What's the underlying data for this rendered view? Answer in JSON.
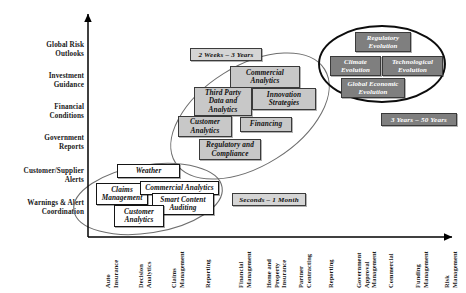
{
  "figure": {
    "title": "",
    "background": "#ffffff",
    "axis_color": "#000000"
  },
  "chart_data": {
    "type": "scatter",
    "title": "",
    "xlabel": "",
    "ylabel": "",
    "grid": false,
    "legend": "none",
    "y_categories": [
      "Global Risk\nOutlooks",
      "Investment\nGuidance",
      "Financial\nConditions",
      "Government\nReports",
      "Customer/Supplier\nAlerts",
      "Warnings & Alert\nCoordination"
    ],
    "x_categories": [
      "Auto\nInsurance",
      "Decision\nAnalytics",
      "Claims\nManagement",
      "Reporting",
      "Financial\nManagement",
      "Home and\nProperty\nInsurance",
      "Partner\nContracting",
      "Reporting",
      "Government\nApproval\nManagement",
      "Commercial",
      "Funding\nManagement",
      "Risk\nManagement"
    ],
    "clusters": [
      {
        "name": "near-term-cluster",
        "timeframe_tag": "Seconds – 1 Month",
        "tag_style": "light",
        "box_style": "white",
        "items": [
          "Weather",
          "Claims\nManagement",
          "Commercial Analytics",
          "Smart Content\nAuditing",
          "Customer\nAnalytics"
        ]
      },
      {
        "name": "mid-term-cluster",
        "timeframe_tag": "2 Weeks – 3 Years",
        "tag_style": "light",
        "box_style": "gray",
        "items": [
          "Commercial\nAnalytics",
          "Third Party\nData and\nAnalytics",
          "Innovation\nStrategies",
          "Customer\nAnalytics",
          "Financing",
          "Regulatory and\nCompliance"
        ]
      },
      {
        "name": "long-term-cluster",
        "timeframe_tag": "3 Years – 50 Years",
        "tag_style": "dark",
        "box_style": "dark",
        "items": [
          "Regulatory\nEvolution",
          "Climate\nEvolution",
          "Technological\nEvolution",
          "Global Economic\nEvolution"
        ]
      }
    ]
  },
  "y_axis": {
    "labels": [
      "Global Risk\nOutlooks",
      "Investment\nGuidance",
      "Financial\nConditions",
      "Government\nReports",
      "Customer/Supplier\nAlerts",
      "Warnings & Alert\nCoordination"
    ]
  },
  "x_axis": {
    "labels": [
      "Auto\nInsurance",
      "Decision\nAnalytics",
      "Claims\nManagement",
      "Reporting",
      "Financial\nManagement",
      "Home and\nProperty\nInsurance",
      "Partner\nContracting",
      "Reporting",
      "Government\nApproval\nManagement",
      "Commercial",
      "Funding\nManagement",
      "Risk\nManagement"
    ]
  },
  "tags": {
    "near": "Seconds – 1 Month",
    "mid": "2 Weeks – 3 Years",
    "long": "3 Years – 50 Years"
  },
  "boxes": {
    "weather": "Weather",
    "claims_management": "Claims\nManagement",
    "commercial_analytics_low": "Commercial Analytics",
    "smart_content_auditing": "Smart Content\nAuditing",
    "customer_analytics_low": "Customer\nAnalytics",
    "commercial_analytics_mid": "Commercial\nAnalytics",
    "third_party_data": "Third Party\nData and\nAnalytics",
    "innovation_strategies": "Innovation\nStrategies",
    "customer_analytics_mid": "Customer\nAnalytics",
    "financing": "Financing",
    "regulatory_compliance": "Regulatory and\nCompliance",
    "regulatory_evolution": "Regulatory\nEvolution",
    "climate_evolution": "Climate\nEvolution",
    "technological_evolution": "Technological\nEvolution",
    "global_economic_evolution": "Global Economic\nEvolution"
  },
  "colors": {
    "white_box": "#ffffff",
    "gray_box": "#c8c8c8",
    "dark_box": "#7f7f7f",
    "tag_light": "#d5d5d5",
    "border": "#333333",
    "text": "#101010",
    "text_inverse": "#ffffff"
  }
}
